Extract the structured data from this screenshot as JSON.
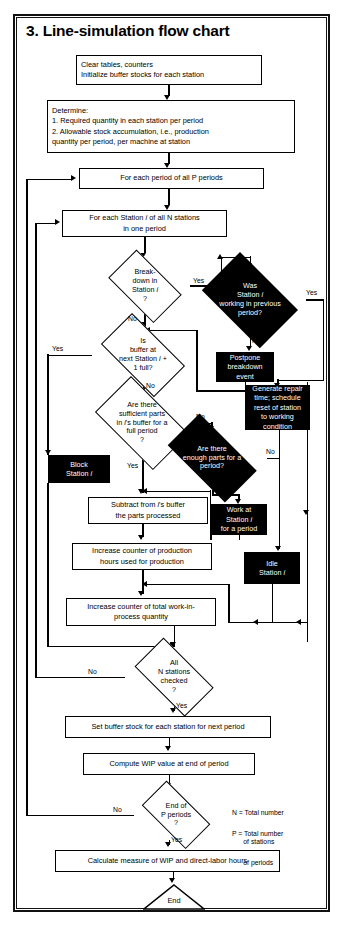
{
  "figure": {
    "title": "3. Line-simulation flow chart",
    "type": "flowchart"
  },
  "legend": {
    "line1": "N = Total number",
    "line2": "      of stations",
    "line3": "P = Total number",
    "line4": "      of periods"
  },
  "nodes": {
    "start_init": {
      "shape": "process",
      "style": "white",
      "text": "Clear tables, counters\nInitialize buffer stocks for each station"
    },
    "determine": {
      "shape": "process",
      "style": "white",
      "text": "Determine:\n1. Required quantity in each station per period\n2. Allowable stock accumulation, i.e., production\n     quantity per period, per machine at station"
    },
    "loop_periods": {
      "shape": "process",
      "style": "white",
      "text": "For each period of all P periods"
    },
    "loop_stations": {
      "shape": "process",
      "style": "white",
      "text": "For each Station i of all N stations\nin one period"
    },
    "breakdown": {
      "shape": "decision",
      "style": "white",
      "text": "Break-\ndown in\nStation i\n?"
    },
    "was_working": {
      "shape": "decision",
      "style": "black",
      "text": "Was\nStation i\nworking in previous\nperiod?"
    },
    "postpone": {
      "shape": "process",
      "style": "black",
      "text": "Postpone\nbreakdown\nevent"
    },
    "generate_repair": {
      "shape": "process",
      "style": "black",
      "text": "Generate repair\ntime; schedule\nreset of station\nto working\ncondition"
    },
    "buffer_full": {
      "shape": "decision",
      "style": "white",
      "text": "Is\nbuffer at\nnext Station i +\n1 full?"
    },
    "sufficient_parts": {
      "shape": "decision",
      "style": "white",
      "text": "Are there\nsufficient parts\nin i's buffer for a\nfull period\n?"
    },
    "enough_parts": {
      "shape": "decision",
      "style": "black",
      "text": "Are there\nenough parts for a\nperiod?"
    },
    "block_station": {
      "shape": "process",
      "style": "black",
      "text": "Block\nStation i"
    },
    "work_station": {
      "shape": "process",
      "style": "black",
      "text": "Work at\nStation i\nfor a period"
    },
    "idle_station": {
      "shape": "process",
      "style": "black",
      "text": "Idle\nStation i"
    },
    "subtract": {
      "shape": "process",
      "style": "white",
      "text": "Subtract from i's buffer\nthe parts processed"
    },
    "incr_hours": {
      "shape": "process",
      "style": "white",
      "text": "Increase counter of production\nhours used for production"
    },
    "incr_wip": {
      "shape": "process",
      "style": "white",
      "text": "Increase counter of total work-in-\nprocess quantity"
    },
    "all_checked": {
      "shape": "decision",
      "style": "white",
      "text": "All\nN stations\nchecked\n?"
    },
    "set_buffer": {
      "shape": "process",
      "style": "white",
      "text": "Set buffer stock for each station for next period"
    },
    "compute_wip": {
      "shape": "process",
      "style": "white",
      "text": "Compute WIP value at end of period"
    },
    "end_periods": {
      "shape": "decision",
      "style": "white",
      "text": "End of\nP periods\n?"
    },
    "calculate": {
      "shape": "process",
      "style": "white",
      "text": "Calculate measure of WIP and direct-labor hours"
    },
    "end": {
      "shape": "terminator",
      "style": "white",
      "text": "End"
    }
  },
  "edge_labels": {
    "breakdown_yes": "Yes",
    "breakdown_no": "No",
    "was_working_yes": "Yes",
    "was_working_no": "No",
    "buffer_full_yes": "Yes",
    "buffer_full_no": "No",
    "sufficient_no": "No",
    "sufficient_yes": "Yes",
    "enough_no": "No",
    "enough_yes": "Yes",
    "all_checked_no": "No",
    "all_checked_yes": "Yes",
    "end_periods_no": "No",
    "end_periods_yes": "Yes"
  },
  "colors": {
    "ink": "#000000",
    "paper": "#ffffff",
    "fill_black": "#000000",
    "text_on_black": "#ffffff"
  }
}
